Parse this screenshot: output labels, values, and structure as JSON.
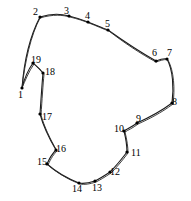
{
  "figure": {
    "width": 191,
    "height": 201,
    "background_color": "#ffffff",
    "stroke_color": "#1a1a1a",
    "label_color": "#000000",
    "marker_color": "#000000"
  },
  "chart_data": {
    "type": "scatter",
    "xlabel": "",
    "ylabel": "",
    "xlim": [
      0,
      191
    ],
    "ylim": [
      0,
      201
    ],
    "grid": false,
    "legend": "none",
    "series": [
      {
        "name": "contour-vertices",
        "points": [
          {
            "id": "1",
            "x": 22,
            "y": 88,
            "label": "1",
            "label_x": 18,
            "label_y": 90
          },
          {
            "id": "2",
            "x": 40,
            "y": 17,
            "label": "2",
            "label_x": 33,
            "label_y": 7
          },
          {
            "id": "3",
            "x": 69,
            "y": 16,
            "label": "3",
            "label_x": 64,
            "label_y": 6
          },
          {
            "id": "4",
            "x": 88,
            "y": 22,
            "label": "4",
            "label_x": 85,
            "label_y": 11
          },
          {
            "id": "5",
            "x": 108,
            "y": 30,
            "label": "5",
            "label_x": 105,
            "label_y": 19
          },
          {
            "id": "6",
            "x": 156,
            "y": 61,
            "label": "6",
            "label_x": 152,
            "label_y": 48
          },
          {
            "id": "7",
            "x": 167,
            "y": 59,
            "label": "7",
            "label_x": 167,
            "label_y": 48
          },
          {
            "id": "8",
            "x": 172,
            "y": 103,
            "label": "8",
            "label_x": 172,
            "label_y": 97
          },
          {
            "id": "9",
            "x": 137,
            "y": 123,
            "label": "9",
            "label_x": 136,
            "label_y": 114
          },
          {
            "id": "10",
            "x": 124,
            "y": 131,
            "label": "10",
            "label_x": 114,
            "label_y": 124
          },
          {
            "id": "11",
            "x": 127,
            "y": 152,
            "label": "11",
            "label_x": 131,
            "label_y": 148
          },
          {
            "id": "12",
            "x": 110,
            "y": 172,
            "label": "12",
            "label_x": 110,
            "label_y": 167
          },
          {
            "id": "13",
            "x": 95,
            "y": 181,
            "label": "13",
            "label_x": 92,
            "label_y": 183
          },
          {
            "id": "14",
            "x": 79,
            "y": 183,
            "label": "14",
            "label_x": 72,
            "label_y": 184
          },
          {
            "id": "15",
            "x": 47,
            "y": 164,
            "label": "15",
            "label_x": 37,
            "label_y": 157
          },
          {
            "id": "16",
            "x": 56,
            "y": 150,
            "label": "16",
            "label_x": 56,
            "label_y": 144
          },
          {
            "id": "17",
            "x": 40,
            "y": 114,
            "label": "17",
            "label_x": 42,
            "label_y": 112
          },
          {
            "id": "18",
            "x": 43,
            "y": 73,
            "label": "18",
            "label_x": 45,
            "label_y": 67
          },
          {
            "id": "19",
            "x": 33,
            "y": 63,
            "label": "19",
            "label_x": 31,
            "label_y": 55
          }
        ]
      }
    ],
    "paths": {
      "outer_contour": "M 22 88 C 24 62 30 36 40 17 C 52 13 62 14 69 16 C 77 18 83 20 88 22 C 96 25 102 28 108 30 C 122 40 140 52 156 61 C 161 59 164 58 167 59 C 173 70 174 88 172 103 C 160 112 148 118 137 123 C 132 127 127 129 124 131 C 126 139 127 146 127 152 C 121 160 115 167 110 172 C 104 176 99 179 95 181 C 89 183 83 184 79 183 C 66 178 55 171 47 164 C 50 157 53 153 56 150 C 49 138 43 125 40 114 C 41 99 42 84 43 73 C 39 68 35 65 33 63 C 28 70 24 80 22 88 Z",
      "smoothed_contour": "M 22 88 C 25 61 31 35 40 18 C 53 14 63 15 70 17 C 78 19 84 21 89 23 C 97 26 103 29 109 31 C 123 42 141 54 156 62 C 162 60 165 59 168 60 C 174 71 175 89 173 104 C 161 113 149 119 138 124 C 133 128 128 130 125 132 C 127 140 128 147 128 153 C 122 161 116 168 111 173 C 105 177 100 180 96 182 C 90 184 84 185 80 184 C 67 179 56 172 48 165 C 51 158 54 154 57 151 C 50 139 44 126 41 115 C 42 100 43 85 44 74 C 40 69 36 66 34 64 C 29 71 25 81 22 88 Z"
    }
  }
}
